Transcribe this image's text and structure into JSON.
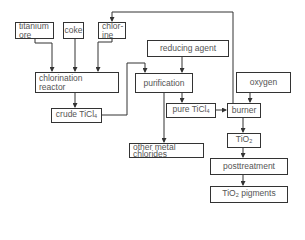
{
  "diagram": {
    "type": "process-flow",
    "nodes": [
      {
        "id": "titanium_ore",
        "label_line1": "titanium",
        "label_line2": "ore"
      },
      {
        "id": "coke",
        "label": "coke"
      },
      {
        "id": "chlorine",
        "label_line1": "chlor-",
        "label_line2": "ine"
      },
      {
        "id": "chlorination_reactor",
        "label_line1": "chlorination",
        "label_line2": "reactor"
      },
      {
        "id": "crude_ticl4",
        "label": "crude TiCl",
        "sub": "4"
      },
      {
        "id": "reducing_agent",
        "label": "reducing agent"
      },
      {
        "id": "purification",
        "label": "purification"
      },
      {
        "id": "pure_ticl4",
        "label": "pure TiCl",
        "sub": "4"
      },
      {
        "id": "oxygen",
        "label": "oxygen"
      },
      {
        "id": "burner",
        "label": "burner"
      },
      {
        "id": "other_metal_chlorides",
        "label_line1": "other metal",
        "label_line2": "chlorides"
      },
      {
        "id": "tio2",
        "label": "TiO",
        "sub": "2"
      },
      {
        "id": "posttreatment",
        "label": "posttreatment"
      },
      {
        "id": "tio2_pigments",
        "label": "TiO",
        "sub": "2",
        "label_after": " pigments"
      }
    ],
    "edges": [
      {
        "from": "titanium_ore",
        "to": "chlorination_reactor"
      },
      {
        "from": "coke",
        "to": "chlorination_reactor"
      },
      {
        "from": "chlorine",
        "to": "chlorination_reactor"
      },
      {
        "from": "chlorination_reactor",
        "to": "crude_ticl4"
      },
      {
        "from": "crude_ticl4",
        "to": "purification"
      },
      {
        "from": "reducing_agent",
        "to": "purification"
      },
      {
        "from": "purification",
        "to": "pure_ticl4"
      },
      {
        "from": "purification",
        "to": "other_metal_chlorides"
      },
      {
        "from": "pure_ticl4",
        "to": "burner"
      },
      {
        "from": "oxygen",
        "to": "burner"
      },
      {
        "from": "burner",
        "to": "chlorine",
        "note": "chlorine recycle"
      },
      {
        "from": "burner",
        "to": "tio2"
      },
      {
        "from": "tio2",
        "to": "posttreatment"
      },
      {
        "from": "posttreatment",
        "to": "tio2_pigments"
      }
    ]
  },
  "colors": {
    "line": "#333333",
    "text": "#555555",
    "background": "#ffffff"
  }
}
